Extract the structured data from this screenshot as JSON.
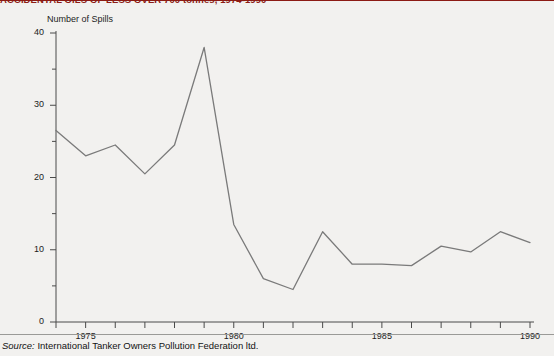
{
  "title": "ACCIDENTAL OILS OF LESS OVER 700 tonnes, 1974-1990",
  "source_keyword": "Source:",
  "source_text": " International Tanker Owners Pollution Federation ltd.",
  "colors": {
    "title": "#8c1b14",
    "line": "#7a7a7a",
    "axis": "#4a4a4a",
    "background": "#f2f1ef",
    "text": "#1c1c1c"
  },
  "chart_data": {
    "type": "line",
    "title": "ACCIDENTAL OILS OF LESS OVER 700 tonnes, 1974-1990",
    "xlabel": "",
    "ylabel": "Number of Spills",
    "xlim": [
      1974,
      1990
    ],
    "ylim": [
      0,
      40
    ],
    "grid": false,
    "legend": null,
    "y_ticks": [
      0,
      10,
      20,
      30,
      40
    ],
    "y_tick_labels": [
      "0",
      "10",
      "20",
      "30",
      "40"
    ],
    "y_minor_ticks": [
      5,
      15,
      25,
      35
    ],
    "x_ticks": [
      1974,
      1975,
      1976,
      1977,
      1978,
      1979,
      1980,
      1981,
      1982,
      1983,
      1984,
      1985,
      1986,
      1987,
      1988,
      1989,
      1990
    ],
    "x_tick_labels_shown": [
      "1975",
      "1980",
      "1985",
      "1990"
    ],
    "x_tick_labels_shown_at": [
      1975,
      1980,
      1985,
      1990
    ],
    "series": [
      {
        "name": "Number of Spills",
        "x": [
          1974,
          1975,
          1976,
          1977,
          1978,
          1979,
          1980,
          1981,
          1982,
          1983,
          1984,
          1985,
          1986,
          1987,
          1988,
          1989,
          1990
        ],
        "values": [
          26.5,
          23.0,
          24.5,
          20.5,
          24.5,
          38.0,
          13.5,
          6.0,
          4.5,
          12.5,
          8.0,
          8.0,
          7.8,
          10.5,
          9.7,
          12.5,
          11.0
        ]
      }
    ]
  }
}
